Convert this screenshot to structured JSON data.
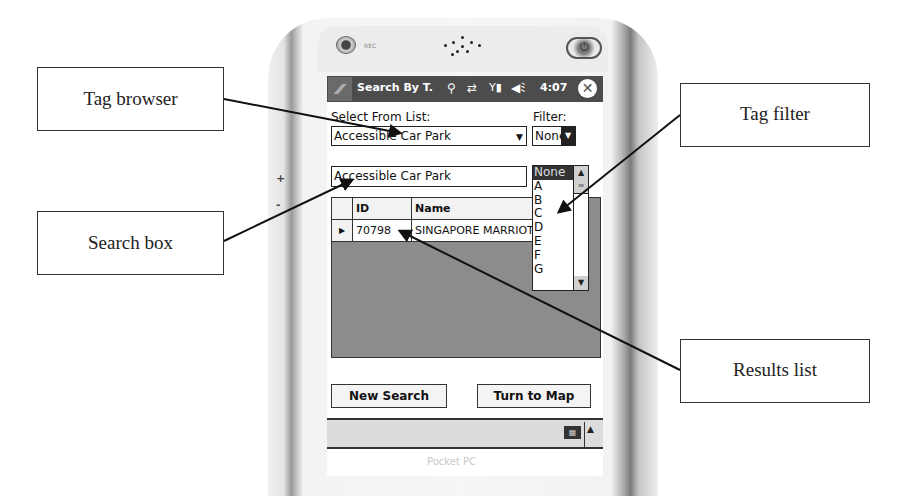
{
  "callouts": {
    "tag_browser": "Tag browser",
    "search_box": "Search box",
    "tag_filter": "Tag filter",
    "results_list": "Results list"
  },
  "device": {
    "rec_label": "REC",
    "side_plus": "+",
    "side_minus": "-",
    "brand": "Pocket PC"
  },
  "titlebar": {
    "start_icon": "windows-flag-icon",
    "title": "Search By T.",
    "status_icons": [
      "antenna-icon",
      "sync-icon",
      "signal-icon",
      "volume-icon"
    ],
    "time": "4:07",
    "close": "✕"
  },
  "form": {
    "select_label": "Select From List:",
    "select_value": "Accessible Car Park",
    "filter_label": "Filter:",
    "filter_value": "None",
    "filter_options": [
      "None",
      "A",
      "B",
      "C",
      "D",
      "E",
      "F",
      "G"
    ],
    "search_value": "Accessible Car Park"
  },
  "results": {
    "columns": [
      "ID",
      "Name"
    ],
    "rows": [
      {
        "id": "70798",
        "name": "SINGAPORE MARRIOTT"
      }
    ]
  },
  "buttons": {
    "new_search": "New Search",
    "turn_to_map": "Turn to Map"
  },
  "colors": {
    "titlebar_bg": "#4c4c4c",
    "grid_bg": "#8c8c8c",
    "selected_option_bg": "#333333"
  }
}
